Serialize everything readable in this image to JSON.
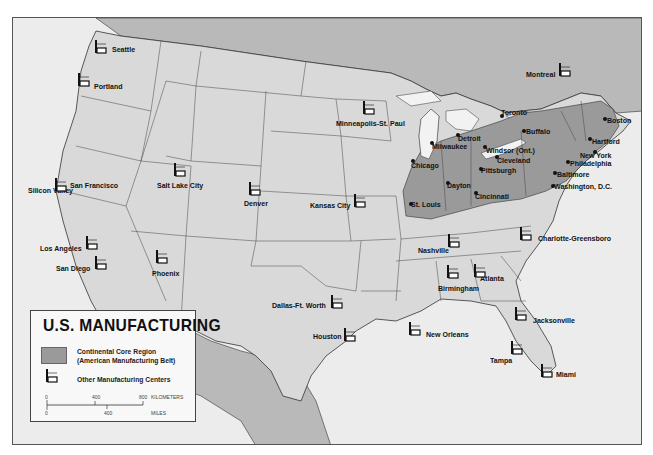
{
  "map": {
    "title": "U.S. MANUFACTURING",
    "colors": {
      "land_us": "#d9d9d9",
      "land_other": "#b9b9b9",
      "water": "#ececec",
      "core_region": "#9a9a9a",
      "border": "#333333"
    }
  },
  "legend": {
    "title": "U.S. MANUFACTURING",
    "core_region_line1": "Continental Core Region",
    "core_region_line2": "(American Manufacturing Belt)",
    "other_centers": "Other Manufacturing Centers",
    "scale": {
      "km_ticks": [
        "0",
        "400",
        "800"
      ],
      "km_unit": "KILOMETERS",
      "mi_ticks": [
        "0",
        "400"
      ],
      "mi_unit": "MILES"
    }
  },
  "core_cities": [
    {
      "name": "Toronto",
      "x": 502,
      "y": 116
    },
    {
      "name": "Buffalo",
      "x": 524,
      "y": 131
    },
    {
      "name": "Boston",
      "x": 605,
      "y": 119
    },
    {
      "name": "Hartford",
      "x": 590,
      "y": 139
    },
    {
      "name": "New York",
      "x": 595,
      "y": 152
    },
    {
      "name": "Philadelphia",
      "x": 568,
      "y": 162
    },
    {
      "name": "Baltimore",
      "x": 555,
      "y": 173
    },
    {
      "name": "Washington, D.C.",
      "x": 553,
      "y": 186
    },
    {
      "name": "Detroit",
      "x": 458,
      "y": 135
    },
    {
      "name": "Milwaukee",
      "x": 432,
      "y": 143
    },
    {
      "name": "Windsor (Ont.)",
      "x": 485,
      "y": 147
    },
    {
      "name": "Cleveland",
      "x": 497,
      "y": 157
    },
    {
      "name": "Chicago",
      "x": 413,
      "y": 161
    },
    {
      "name": "Pittsburgh",
      "x": 481,
      "y": 169
    },
    {
      "name": "Dayton",
      "x": 448,
      "y": 183
    },
    {
      "name": "Cincinnati",
      "x": 476,
      "y": 193
    },
    {
      "name": "St. Louis",
      "x": 411,
      "y": 204
    }
  ],
  "other_centers": [
    {
      "name": "Seattle"
    },
    {
      "name": "Portland"
    },
    {
      "name": "Montreal"
    },
    {
      "name": "Minneapolis-St. Paul"
    },
    {
      "name": "Silicon Valley"
    },
    {
      "name": "San Francisco"
    },
    {
      "name": "Salt Lake City"
    },
    {
      "name": "Denver"
    },
    {
      "name": "Kansas City"
    },
    {
      "name": "Los Angeles"
    },
    {
      "name": "San Diego"
    },
    {
      "name": "Phoenix"
    },
    {
      "name": "Nashville"
    },
    {
      "name": "Charlotte-Greensboro"
    },
    {
      "name": "Birmingham"
    },
    {
      "name": "Atlanta"
    },
    {
      "name": "Dallas-Ft. Worth"
    },
    {
      "name": "Houston"
    },
    {
      "name": "New Orleans"
    },
    {
      "name": "Jacksonville"
    },
    {
      "name": "Tampa"
    },
    {
      "name": "Miami"
    }
  ]
}
